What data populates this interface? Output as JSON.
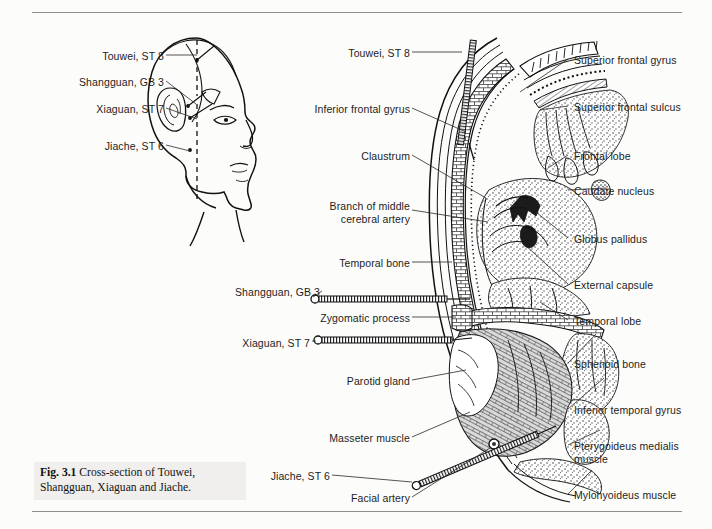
{
  "page": {
    "background": "#fcfcfb",
    "rule_color": "#8e8e8e",
    "ink_color": "#111111",
    "text_color": "#1c1c1c"
  },
  "caption": {
    "figure_number": "Fig. 3.1",
    "text": "Cross-section of Touwei, Shangguan, Xiaguan and Jiache."
  },
  "head_diagram": {
    "name": "lateral-head-acupoint-profile",
    "labels": [
      {
        "id": "touwei",
        "text": "Touwei, ST 8",
        "x": 56,
        "y": 50,
        "w": 108,
        "anchor": "right"
      },
      {
        "id": "shangguan",
        "text": "Shangguan, GB 3",
        "x": 24,
        "y": 76,
        "w": 140,
        "anchor": "right"
      },
      {
        "id": "xiaguan",
        "text": "Xiaguan, ST 7",
        "x": 48,
        "y": 103,
        "w": 116,
        "anchor": "right"
      },
      {
        "id": "jiache",
        "text": "Jiache, ST 6",
        "x": 54,
        "y": 140,
        "w": 110,
        "anchor": "right"
      }
    ]
  },
  "cross_section": {
    "name": "coronal-cross-section-of-head",
    "labels_left": [
      {
        "id": "touwei-st8",
        "text": "Touwei, ST 8",
        "x": 270,
        "y": 47,
        "w": 140,
        "lines": 1
      },
      {
        "id": "inferior-frontal-gyrus",
        "text": "Inferior frontal gyrus",
        "x": 270,
        "y": 103,
        "w": 140,
        "lines": 1
      },
      {
        "id": "claustrum",
        "text": "Claustrum",
        "x": 270,
        "y": 150,
        "w": 140,
        "lines": 1
      },
      {
        "id": "branch-mca",
        "text": "Branch of middle\ncerebral artery",
        "x": 270,
        "y": 200,
        "w": 140,
        "lines": 2
      },
      {
        "id": "temporal-bone",
        "text": "Temporal bone",
        "x": 270,
        "y": 257,
        "w": 140,
        "lines": 1
      },
      {
        "id": "shangguan-gb3",
        "text": "Shangguan, GB 3",
        "x": 180,
        "y": 286,
        "w": 140,
        "lines": 1
      },
      {
        "id": "zygomatic-process",
        "text": "Zygomatic process",
        "x": 270,
        "y": 312,
        "w": 140,
        "lines": 1
      },
      {
        "id": "xiaguan-st7",
        "text": "Xiaguan, ST 7",
        "x": 180,
        "y": 337,
        "w": 130,
        "lines": 1
      },
      {
        "id": "parotid-gland",
        "text": "Parotid gland",
        "x": 270,
        "y": 375,
        "w": 140,
        "lines": 1
      },
      {
        "id": "masseter-muscle",
        "text": "Masseter muscle",
        "x": 270,
        "y": 432,
        "w": 140,
        "lines": 1
      },
      {
        "id": "jiache-st6",
        "text": "Jiache, ST 6",
        "x": 200,
        "y": 470,
        "w": 130,
        "lines": 1
      },
      {
        "id": "facial-artery",
        "text": "Facial artery",
        "x": 270,
        "y": 492,
        "w": 140,
        "lines": 1
      }
    ],
    "labels_right": [
      {
        "id": "superior-frontal-gyrus",
        "text": "Superior frontal gyrus",
        "x": 574,
        "y": 54,
        "lines": 1
      },
      {
        "id": "superior-frontal-sulcus",
        "text": "Superior frontal sulcus",
        "x": 574,
        "y": 101,
        "lines": 1
      },
      {
        "id": "frontal-lobe",
        "text": "Frontal lobe",
        "x": 574,
        "y": 150,
        "lines": 1
      },
      {
        "id": "caudate-nucleus",
        "text": "Caudate nucleus",
        "x": 574,
        "y": 185,
        "lines": 1
      },
      {
        "id": "globus-pallidus",
        "text": "Globus pallidus",
        "x": 574,
        "y": 233,
        "lines": 1
      },
      {
        "id": "external-capsule",
        "text": "External capsule",
        "x": 574,
        "y": 279,
        "lines": 1
      },
      {
        "id": "temporal-lobe",
        "text": "Temporal lobe",
        "x": 574,
        "y": 315,
        "lines": 1
      },
      {
        "id": "sphenoid-bone",
        "text": "Sphenoid bone",
        "x": 574,
        "y": 358,
        "lines": 1
      },
      {
        "id": "inferior-temporal-gyrus",
        "text": "Inferior temporal gyrus",
        "x": 574,
        "y": 404,
        "lines": 1
      },
      {
        "id": "pterygoideus-medialis",
        "text": "Pterygoideus medialis\nmuscle",
        "x": 574,
        "y": 440,
        "lines": 2
      },
      {
        "id": "mylohyoideus-muscle",
        "text": "Mylohyoideus muscle",
        "x": 574,
        "y": 489,
        "lines": 1
      }
    ],
    "needles": [
      {
        "id": "needle-touwei",
        "point": "Touwei, ST 8"
      },
      {
        "id": "needle-shangguan",
        "point": "Shangguan, GB 3"
      },
      {
        "id": "needle-xiaguan",
        "point": "Xiaguan, ST 7"
      },
      {
        "id": "needle-jiache",
        "point": "Jiache, ST 6"
      }
    ]
  }
}
